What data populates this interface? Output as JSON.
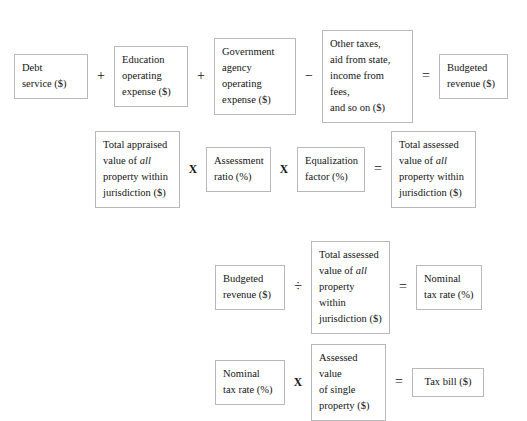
{
  "diagram": {
    "title_partial": "",
    "colors": {
      "background": "#ffffff",
      "box_border": "#b8b8b8",
      "text": "#141414"
    },
    "rows": [
      {
        "id": "row1",
        "name": "budgeted-revenue-equation",
        "items": [
          {
            "kind": "box",
            "lines": [
              "Debt",
              "service ($)"
            ]
          },
          {
            "kind": "op",
            "symbol": "+",
            "name": "plus"
          },
          {
            "kind": "box",
            "lines": [
              "Education",
              "operating",
              "expense ($)"
            ]
          },
          {
            "kind": "op",
            "symbol": "+",
            "name": "plus"
          },
          {
            "kind": "box",
            "lines": [
              "Government",
              "agency",
              "operating",
              "expense ($)"
            ]
          },
          {
            "kind": "op",
            "symbol": "−",
            "name": "minus"
          },
          {
            "kind": "box",
            "lines": [
              "Other taxes,",
              "aid from state,",
              "income from fees,",
              "and so on ($)"
            ]
          },
          {
            "kind": "op",
            "symbol": "=",
            "name": "equals"
          },
          {
            "kind": "box",
            "lines": [
              "Budgeted",
              "revenue ($)"
            ]
          }
        ]
      },
      {
        "id": "row2",
        "name": "total-assessed-value-equation",
        "items": [
          {
            "kind": "box",
            "html": "Total appraised\nvalue of <i>all</i>\nproperty within\njurisdiction ($)"
          },
          {
            "kind": "op",
            "symbol": "X",
            "name": "times"
          },
          {
            "kind": "box",
            "lines": [
              "Assessment",
              "ratio (%)"
            ]
          },
          {
            "kind": "op",
            "symbol": "X",
            "name": "times"
          },
          {
            "kind": "box",
            "lines": [
              "Equalization",
              "factor (%)"
            ]
          },
          {
            "kind": "op",
            "symbol": "=",
            "name": "equals"
          },
          {
            "kind": "box",
            "html": "Total assessed\nvalue of <i>all</i>\nproperty within\njurisdiction ($)"
          }
        ]
      },
      {
        "id": "row3",
        "name": "nominal-tax-rate-equation",
        "items": [
          {
            "kind": "box",
            "lines": [
              "Budgeted",
              "revenue ($)"
            ]
          },
          {
            "kind": "op",
            "symbol": "÷",
            "name": "divide"
          },
          {
            "kind": "box",
            "html": "Total assessed\nvalue of <i>all</i>\nproperty within\njurisdiction ($)"
          },
          {
            "kind": "op",
            "symbol": "=",
            "name": "equals"
          },
          {
            "kind": "box",
            "lines": [
              "Nominal",
              "tax rate (%)"
            ]
          }
        ]
      },
      {
        "id": "row4",
        "name": "tax-bill-equation",
        "items": [
          {
            "kind": "box",
            "lines": [
              "Nominal",
              "tax rate (%)"
            ]
          },
          {
            "kind": "op",
            "symbol": "X",
            "name": "times"
          },
          {
            "kind": "box",
            "lines": [
              "Assessed value",
              "of single",
              "property ($)"
            ]
          },
          {
            "kind": "op",
            "symbol": "=",
            "name": "equals"
          },
          {
            "kind": "box",
            "lines": [
              "Tax bill ($)"
            ]
          }
        ]
      }
    ]
  },
  "r1": {
    "b1": "Debt\nservice ($)",
    "op1": "+",
    "b2": "Education\noperating\nexpense ($)",
    "op2": "+",
    "b3": "Government\nagency\noperating\nexpense ($)",
    "op3": "−",
    "b4": "Other taxes,\naid from state,\nincome from fees,\nand so on ($)",
    "op4": "=",
    "b5": "Budgeted\nrevenue ($)"
  },
  "r2": {
    "b1_l1": "Total appraised",
    "b1_l2a": "value of ",
    "b1_l2b": "all",
    "b1_l3": "property within",
    "b1_l4": "jurisdiction ($)",
    "op1": "X",
    "b2": "Assessment\nratio (%)",
    "op2": "X",
    "b3": "Equalization\nfactor (%)",
    "op3": "=",
    "b4_l1": "Total assessed",
    "b4_l2a": "value of ",
    "b4_l2b": "all",
    "b4_l3": "property within",
    "b4_l4": "jurisdiction ($)"
  },
  "r3": {
    "b1": "Budgeted\nrevenue ($)",
    "op1": "÷",
    "b2_l1": "Total assessed",
    "b2_l2a": "value of ",
    "b2_l2b": "all",
    "b2_l3": "property within",
    "b2_l4": "jurisdiction ($)",
    "op2": "=",
    "b3": "Nominal\ntax rate (%)"
  },
  "r4": {
    "b1": "Nominal\ntax rate (%)",
    "op1": "X",
    "b2": "Assessed value\nof single\nproperty ($)",
    "op2": "=",
    "b3": "Tax bill ($)"
  }
}
